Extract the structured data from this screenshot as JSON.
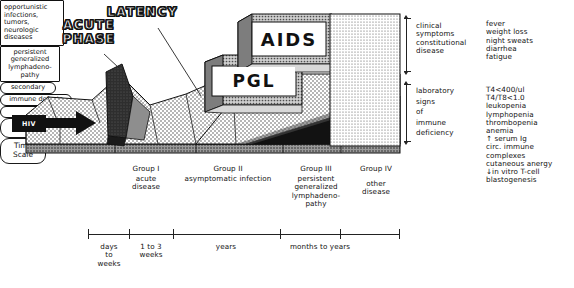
{
  "figure": {
    "type": "medical-progression-diagram"
  },
  "headings": {
    "acute_phase": "ACUTE\nPHASE",
    "latency": "LATENCY"
  },
  "entry_tag": {
    "label": "HIV"
  },
  "blocks": {
    "pgl": {
      "label": "PGL"
    },
    "aids": {
      "label": "AIDS"
    }
  },
  "callouts": {
    "opportunistic": "opportunistic\ninfections,\ntumors,\nneurologic\ndiseases",
    "pgl_detail": "persistent\ngeneralized\nlymphadeno-\npathy",
    "secondary": "secondary",
    "immune_defects": "immune defects",
    "monocyte": "monocyte/T4-cell dysfunction"
  },
  "right_panel": {
    "groups": [
      {
        "name": "clinical-findings",
        "category": "clinical\nsymptoms\nconstitutional\ndisease",
        "items": "fever\nweight loss\nnight sweats\ndiarrhea\nfatigue"
      },
      {
        "name": "laboratory-findings",
        "category": "laboratory\nsigns\nof\nimmune\ndeficiency",
        "items": "T4<400/ul\nT4/T8<1.0\nleukopenia\nlymphopenia\nthrombopenia\nanemia\n↑ serum Ig\ncirc. immune\n   complexes\ncutaneous anergy\n↓in vitro T-cell\n   blastogenesis"
      }
    ]
  },
  "cdc_row": {
    "label": "CDC Classification",
    "stages": [
      {
        "title": "Group I",
        "desc": "acute\ndisease"
      },
      {
        "title": "Group II",
        "desc": "asymptomatic infection"
      },
      {
        "title": "Group III",
        "desc": "persistent\ngeneralized\nlymphadeno-\npathy"
      },
      {
        "title": "Group IV",
        "desc": "other\ndisease"
      }
    ]
  },
  "time_row": {
    "label": "Time\nScale",
    "intervals": [
      {
        "text": "days\nto\nweeks"
      },
      {
        "text": "1 to 3\nweeks"
      },
      {
        "text": "years"
      },
      {
        "text": "months to years"
      }
    ]
  },
  "colors": {
    "ink": "#111111",
    "paper": "#ffffff",
    "dark_peak": "#2b2b2b",
    "mid_gray": "#8c8c8c",
    "light_stipple": "#e8e8e8"
  }
}
